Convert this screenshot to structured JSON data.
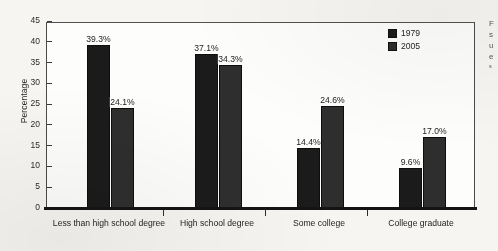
{
  "chart_data": {
    "type": "bar",
    "title": "",
    "xlabel": "",
    "ylabel": "Percentage",
    "ylim": [
      0,
      45
    ],
    "yticks": [
      0,
      5,
      10,
      15,
      20,
      25,
      30,
      35,
      40,
      45
    ],
    "grid": false,
    "legend_position": "top-right",
    "categories": [
      "Less than high school degree",
      "High school degree",
      "Some college",
      "College graduate"
    ],
    "series": [
      {
        "name": "1979",
        "color": "#1b1b1b",
        "values": [
          39.3,
          37.1,
          14.4,
          9.6
        ],
        "labels": [
          "39.3%",
          "37.1%",
          "14.4%",
          "9.6%"
        ]
      },
      {
        "name": "2005",
        "color": "#2e2e2e",
        "values": [
          24.1,
          34.3,
          24.6,
          17.0
        ],
        "labels": [
          "24.1%",
          "34.3%",
          "24.6%",
          "17.0%"
        ]
      }
    ]
  },
  "legend": {
    "items": [
      {
        "label": "1979",
        "color": "#1b1b1b"
      },
      {
        "label": "2005",
        "color": "#2e2e2e"
      }
    ]
  },
  "margin_text": {
    "lines": [
      "F",
      "s",
      "u",
      "e"
    ],
    "small": "s"
  }
}
